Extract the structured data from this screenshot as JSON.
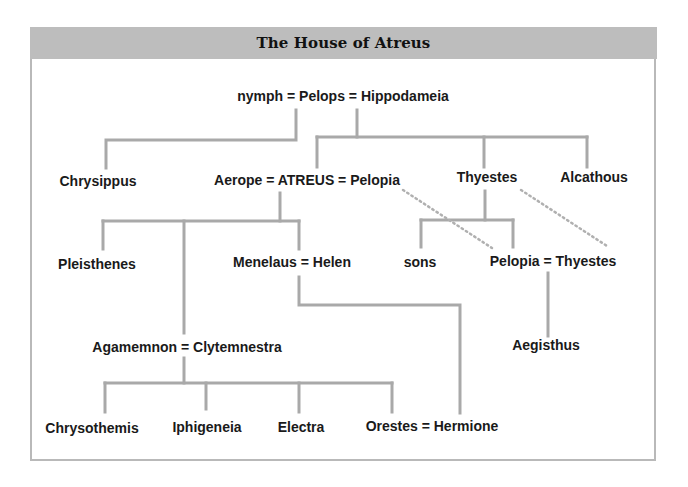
{
  "title": "The House of Atreus",
  "colors": {
    "banner": "#bdbdbd",
    "frame": "#b9b9b9",
    "line": "#a9a9a9",
    "dotted": "#b0b0b0",
    "text": "#1a1a1a"
  },
  "nodes": {
    "pelops_union": "nymph = Pelops = Hippodameia",
    "chrysippus": "Chrysippus",
    "atreus_union": "Aerope = ATREUS = Pelopia",
    "thyestes": "Thyestes",
    "alcathous": "Alcathous",
    "pleisthenes": "Pleisthenes",
    "menelaus_union": "Menelaus = Helen",
    "sons": "sons",
    "pelopia_thyestes_union": "Pelopia = Thyestes",
    "agamemnon_union": "Agamemnon = Clytemnestra",
    "aegisthus": "Aegisthus",
    "chrysothemis": "Chrysothemis",
    "iphigeneia": "Iphigeneia",
    "electra": "Electra",
    "orestes_union": "Orestes = Hermione"
  },
  "relationships": [
    {
      "from": "nymph = Pelops",
      "to": "Chrysippus",
      "type": "child"
    },
    {
      "from": "Pelops = Hippodameia",
      "to": "ATREUS",
      "type": "child"
    },
    {
      "from": "Pelops = Hippodameia",
      "to": "Thyestes",
      "type": "child"
    },
    {
      "from": "Pelops = Hippodameia",
      "to": "Alcathous",
      "type": "child"
    },
    {
      "from": "Aerope = ATREUS",
      "to": "Pleisthenes",
      "type": "child"
    },
    {
      "from": "Aerope = ATREUS",
      "to": "Agamemnon",
      "type": "child"
    },
    {
      "from": "Aerope = ATREUS",
      "to": "Menelaus",
      "type": "child"
    },
    {
      "from": "Thyestes",
      "to": "sons",
      "type": "child"
    },
    {
      "from": "Thyestes",
      "to": "Pelopia",
      "type": "child"
    },
    {
      "from": "Pelopia (wife of Atreus)",
      "to": "Pelopia (= Thyestes)",
      "type": "same-person-dotted"
    },
    {
      "from": "Thyestes",
      "to": "Thyestes (= Pelopia)",
      "type": "same-person-dotted"
    },
    {
      "from": "Pelopia = Thyestes",
      "to": "Aegisthus",
      "type": "child"
    },
    {
      "from": "Menelaus = Helen",
      "to": "Hermione",
      "type": "child"
    },
    {
      "from": "Agamemnon = Clytemnestra",
      "to": "Chrysothemis",
      "type": "child"
    },
    {
      "from": "Agamemnon = Clytemnestra",
      "to": "Iphigeneia",
      "type": "child"
    },
    {
      "from": "Agamemnon = Clytemnestra",
      "to": "Electra",
      "type": "child"
    },
    {
      "from": "Agamemnon = Clytemnestra",
      "to": "Orestes",
      "type": "child"
    }
  ]
}
